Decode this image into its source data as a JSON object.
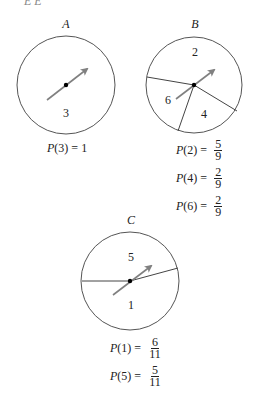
{
  "top_fragment": "E  E",
  "spinners": [
    {
      "id": "A",
      "label": "A",
      "center": [
        66,
        85
      ],
      "radius": 49,
      "sectors": [
        {
          "value": "3",
          "pos": [
            66,
            113
          ]
        }
      ],
      "divider_lines": [],
      "probabilities": [
        {
          "text": "P(3) = ",
          "p": "P",
          "arg": "(3)",
          "eq": " = ",
          "whole": "1"
        }
      ]
    },
    {
      "id": "B",
      "label": "B",
      "center": [
        194,
        85
      ],
      "radius": 48,
      "sectors": [
        {
          "value": "2",
          "pos": [
            195,
            52
          ]
        },
        {
          "value": "6",
          "pos": [
            168,
            99
          ]
        },
        {
          "value": "4",
          "pos": [
            204,
            114
          ]
        }
      ],
      "divider_lines": [
        [
          [
            147,
            77
          ],
          [
            194,
            85
          ]
        ],
        [
          [
            194,
            85
          ],
          [
            237,
            111
          ]
        ],
        [
          [
            194,
            85
          ],
          [
            178,
            131
          ]
        ]
      ],
      "probabilities": [
        {
          "p": "P",
          "arg": "(2)",
          "eq": " = ",
          "num": "5",
          "den": "9"
        },
        {
          "p": "P",
          "arg": "(4)",
          "eq": " = ",
          "num": "2",
          "den": "9"
        },
        {
          "p": "P",
          "arg": "(6)",
          "eq": " = ",
          "num": "2",
          "den": "9"
        }
      ]
    },
    {
      "id": "C",
      "label": "C",
      "center": [
        130,
        281
      ],
      "radius": 49,
      "sectors": [
        {
          "value": "5",
          "pos": [
            131,
            257
          ]
        },
        {
          "value": "1",
          "pos": [
            131,
            305
          ]
        }
      ],
      "divider_lines": [
        [
          [
            82,
            281
          ],
          [
            130,
            281
          ]
        ],
        [
          [
            130,
            281
          ],
          [
            178,
            268
          ]
        ]
      ],
      "probabilities": [
        {
          "p": "P",
          "arg": "(1)",
          "eq": " = ",
          "num": "6",
          "den": "11"
        },
        {
          "p": "P",
          "arg": "(5)",
          "eq": " = ",
          "num": "5",
          "den": "11"
        }
      ]
    }
  ],
  "colors": {
    "circle_stroke": "#555555",
    "arrow": "#808080",
    "hub": "#000000",
    "text": "#222222"
  }
}
